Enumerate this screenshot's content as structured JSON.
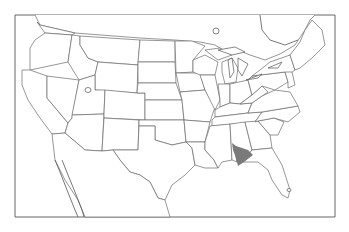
{
  "map": {
    "region": "Contiguous United States with southern Canada and northern Mexico",
    "style": "outline map, state borders",
    "highlight": {
      "label": "range",
      "location": "west-central Alabama into east Mississippi",
      "color": "#7a7a7a"
    },
    "colors": {
      "background": "#ffffff",
      "lines": "#6a6a6a",
      "frame": "#555555"
    }
  }
}
